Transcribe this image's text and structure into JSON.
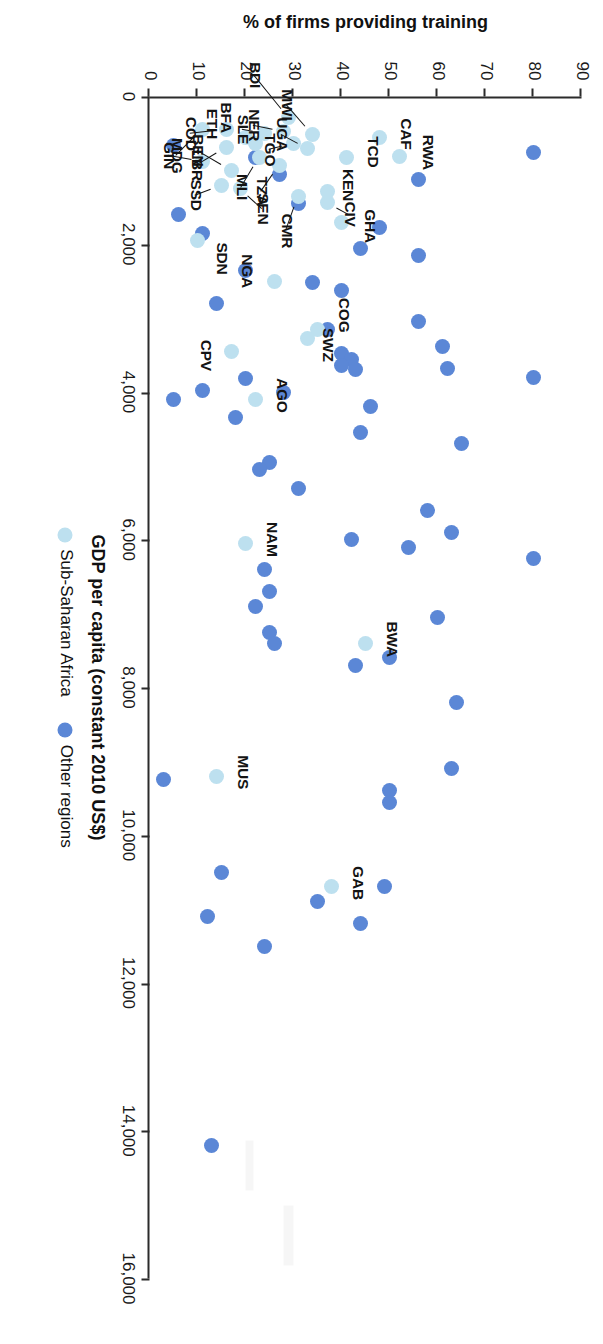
{
  "figure": {
    "x_axis": {
      "title": "GDP per capita (constant 2010 US$)",
      "ticks": [
        "0",
        "2,000",
        "4,000",
        "6,000",
        "8,000",
        "10,000",
        "12,000",
        "14,000",
        "16,000"
      ],
      "min": 0,
      "max": 16000
    },
    "y_axis": {
      "title": "% of firms providing training",
      "ticks": [
        "0",
        "10",
        "20",
        "30",
        "40",
        "50",
        "60",
        "70",
        "80",
        "90"
      ],
      "min": 0,
      "max": 90
    },
    "legend": {
      "items": [
        {
          "label": "Sub-Saharan Africa",
          "color": "#bde0ef",
          "marker": "circle"
        },
        {
          "label": "Other regions",
          "color": "#5b87d6",
          "marker": "circle"
        }
      ]
    }
  },
  "chart_data": {
    "type": "scatter",
    "title": "",
    "xlabel": "GDP per capita (constant 2010 US$)",
    "ylabel": "% of firms providing training",
    "xlim": [
      0,
      16000
    ],
    "ylim": [
      0,
      90
    ],
    "grid": false,
    "legend_position": "bottom-center",
    "series": [
      {
        "name": "Sub-Saharan Africa",
        "color": "#bde0ef",
        "points": [
          {
            "label": "CAF",
            "x": 560,
            "y": 48
          },
          {
            "label": "RWA",
            "x": 810,
            "y": 52
          },
          {
            "label": "MWI",
            "x": 520,
            "y": 34
          },
          {
            "label": "BDI",
            "x": 280,
            "y": 29
          },
          {
            "label": "UGA",
            "x": 700,
            "y": 33
          },
          {
            "label": "TCD",
            "x": 830,
            "y": 41
          },
          {
            "label": "TGO",
            "x": 640,
            "y": 30
          },
          {
            "label": "NER",
            "x": 470,
            "y": 28
          },
          {
            "label": "TZA",
            "x": 930,
            "y": 27
          },
          {
            "label": "CMR",
            "x": 1360,
            "y": 31
          },
          {
            "label": "CIV",
            "x": 1430,
            "y": 37
          },
          {
            "label": "GHA",
            "x": 1700,
            "y": 40
          },
          {
            "label": "KEN",
            "x": 1280,
            "y": 37
          },
          {
            "label": "BFA",
            "x": 640,
            "y": 22
          },
          {
            "label": "ETH",
            "x": 560,
            "y": 20
          },
          {
            "label": "SLE",
            "x": 500,
            "y": 24
          },
          {
            "label": "MLI",
            "x": 820,
            "y": 23
          },
          {
            "label": "BEN",
            "x": 1000,
            "y": 17
          },
          {
            "label": "COD",
            "x": 450,
            "y": 16
          },
          {
            "label": "LBR",
            "x": 690,
            "y": 16
          },
          {
            "label": "SSD",
            "x": 1200,
            "y": 15
          },
          {
            "label": "SEN",
            "x": 1250,
            "y": 19
          },
          {
            "label": "GIN",
            "x": 880,
            "y": 11
          },
          {
            "label": "MDG",
            "x": 450,
            "y": 11
          },
          {
            "label": "SDN",
            "x": 1950,
            "y": 10
          },
          {
            "label": "NGA",
            "x": 2500,
            "y": 26
          },
          {
            "label": "COG",
            "x": 3150,
            "y": 35
          },
          {
            "label": "SWZ",
            "x": 3280,
            "y": 33
          },
          {
            "label": "AGO",
            "x": 4100,
            "y": 22
          },
          {
            "label": "CPV",
            "x": 3450,
            "y": 17
          },
          {
            "label": "NAM",
            "x": 6050,
            "y": 20
          },
          {
            "label": "BWA",
            "x": 7400,
            "y": 45
          },
          {
            "label": "MUS",
            "x": 9200,
            "y": 14
          },
          {
            "label": "GAB",
            "x": 10700,
            "y": 38
          }
        ]
      },
      {
        "name": "Other regions",
        "color": "#5b87d6",
        "points": [
          {
            "x": 760,
            "y": 80
          },
          {
            "x": 1120,
            "y": 56
          },
          {
            "x": 1780,
            "y": 48
          },
          {
            "x": 2060,
            "y": 44
          },
          {
            "x": 2150,
            "y": 56
          },
          {
            "x": 2520,
            "y": 34
          },
          {
            "x": 2630,
            "y": 40
          },
          {
            "x": 3050,
            "y": 56
          },
          {
            "x": 3150,
            "y": 37
          },
          {
            "x": 3380,
            "y": 61
          },
          {
            "x": 3480,
            "y": 40
          },
          {
            "x": 3560,
            "y": 42
          },
          {
            "x": 3640,
            "y": 40
          },
          {
            "x": 3700,
            "y": 43
          },
          {
            "x": 3680,
            "y": 62
          },
          {
            "x": 3800,
            "y": 80
          },
          {
            "x": 3820,
            "y": 20
          },
          {
            "x": 3980,
            "y": 11
          },
          {
            "x": 4200,
            "y": 46
          },
          {
            "x": 4350,
            "y": 18
          },
          {
            "x": 4550,
            "y": 44
          },
          {
            "x": 4700,
            "y": 65
          },
          {
            "x": 4950,
            "y": 25
          },
          {
            "x": 5050,
            "y": 23
          },
          {
            "x": 5300,
            "y": 31
          },
          {
            "x": 5600,
            "y": 58
          },
          {
            "x": 5900,
            "y": 63
          },
          {
            "x": 6000,
            "y": 42
          },
          {
            "x": 6100,
            "y": 54
          },
          {
            "x": 6250,
            "y": 80
          },
          {
            "x": 6400,
            "y": 24
          },
          {
            "x": 6700,
            "y": 25
          },
          {
            "x": 6900,
            "y": 22
          },
          {
            "x": 7050,
            "y": 60
          },
          {
            "x": 7250,
            "y": 25
          },
          {
            "x": 7400,
            "y": 26
          },
          {
            "x": 7600,
            "y": 50
          },
          {
            "x": 7700,
            "y": 43
          },
          {
            "x": 8200,
            "y": 64
          },
          {
            "x": 9100,
            "y": 63
          },
          {
            "x": 9400,
            "y": 50
          },
          {
            "x": 9550,
            "y": 50
          },
          {
            "x": 9250,
            "y": 3
          },
          {
            "x": 10500,
            "y": 15
          },
          {
            "x": 10700,
            "y": 49
          },
          {
            "x": 10900,
            "y": 35
          },
          {
            "x": 11100,
            "y": 12
          },
          {
            "x": 11200,
            "y": 44
          },
          {
            "x": 11500,
            "y": 24
          },
          {
            "x": 14200,
            "y": 13
          },
          {
            "x": 1850,
            "y": 11
          },
          {
            "x": 1450,
            "y": 31
          },
          {
            "x": 1050,
            "y": 27
          },
          {
            "x": 820,
            "y": 22
          },
          {
            "x": 660,
            "y": 5
          },
          {
            "x": 2350,
            "y": 20
          },
          {
            "x": 2800,
            "y": 14
          },
          {
            "x": 4100,
            "y": 5
          },
          {
            "x": 1600,
            "y": 6
          },
          {
            "x": 4000,
            "y": 28
          }
        ]
      }
    ]
  }
}
